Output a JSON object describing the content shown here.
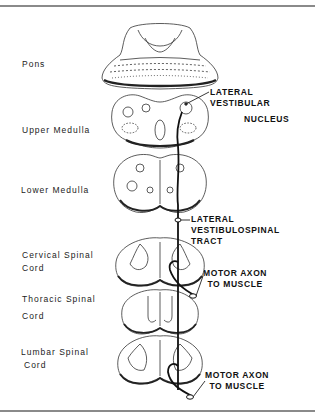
{
  "figure": {
    "levels": [
      {
        "id": "pons",
        "label_lines": [
          "Pons"
        ]
      },
      {
        "id": "upper-medulla",
        "label_lines": [
          "Upper Medulla"
        ]
      },
      {
        "id": "lower-medulla",
        "label_lines": [
          "Lower Medulla"
        ]
      },
      {
        "id": "cervical-spinal-cord",
        "label_lines": [
          "Cervical Spinal",
          "Cord"
        ]
      },
      {
        "id": "thoracic-spinal-cord",
        "label_lines": [
          "Thoracic Spinal",
          "Cord"
        ]
      },
      {
        "id": "lumbar-spinal-cord",
        "label_lines": [
          "Lumbar Spinal",
          "Cord"
        ]
      }
    ],
    "callouts": [
      {
        "id": "lateral-vestibular-nucleus",
        "lines": [
          "LATERAL VESTIBULAR",
          "NUCLEUS"
        ]
      },
      {
        "id": "lateral-vestibulospinal-tract",
        "lines": [
          "LATERAL",
          "VESTIBULOSPINAL",
          "TRACT"
        ]
      },
      {
        "id": "motor-axon-cervical",
        "lines": [
          "MOTOR AXON",
          "TO MUSCLE"
        ]
      },
      {
        "id": "motor-axon-lumbar",
        "lines": [
          "MOTOR AXON",
          "TO MUSCLE"
        ]
      }
    ]
  }
}
